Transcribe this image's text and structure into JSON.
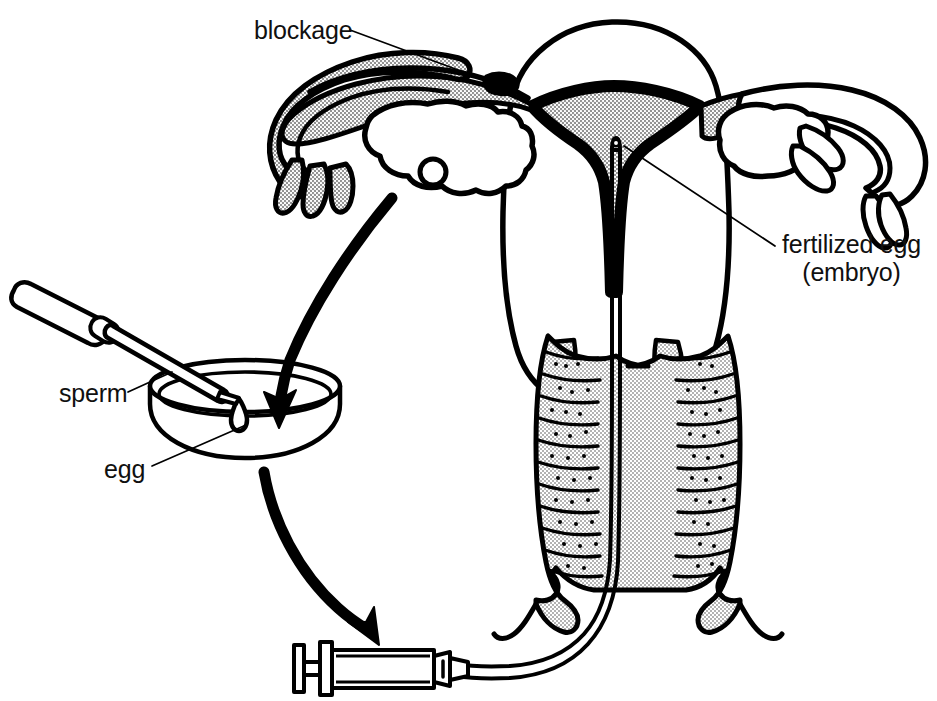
{
  "figure": {
    "background_color": "#ffffff",
    "ink_color": "#000000",
    "shade_color": "#c9c9c9"
  },
  "labels": {
    "blockage": "blockage",
    "fertilized_egg_line1": "fertilized egg",
    "fertilized_egg_line2": "(embryo)",
    "sperm": "sperm",
    "egg": "egg"
  },
  "anatomy": {
    "uterus": "uterus",
    "uterine_cavity": "uterine cavity",
    "cervix": "cervix",
    "vagina": "vagina",
    "left_fallopian_tube": "left fallopian tube",
    "right_fallopian_tube": "right fallopian tube",
    "left_ovary": "left ovary",
    "right_ovary": "right ovary",
    "left_fimbriae": "left fimbriae",
    "right_fimbriae": "right fimbriae",
    "follicle": "follicle"
  },
  "equipment": {
    "pipette": "sperm pipette",
    "petri_dish": "petri dish",
    "droplet": "egg droplet",
    "syringe": "syringe",
    "catheter": "transfer catheter"
  },
  "arrows": [
    {
      "name": "ovary-to-dish",
      "from": "left ovary",
      "to": "petri dish"
    },
    {
      "name": "dish-to-syringe",
      "from": "petri dish",
      "to": "syringe"
    }
  ]
}
